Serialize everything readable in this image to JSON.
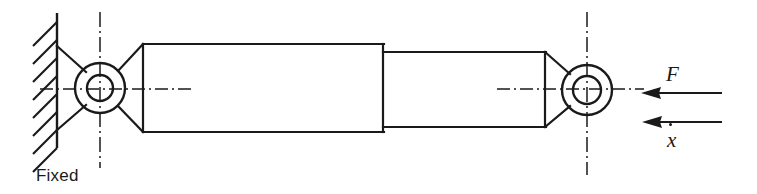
{
  "figure": {
    "type": "engineering-schematic",
    "canvas": {
      "width": 757,
      "height": 194
    },
    "colors": {
      "line": "#1a1a1a",
      "background": "#ffffff"
    }
  },
  "labels": {
    "fixed": "Fixed",
    "force": "F",
    "velocity": "x",
    "velocity_notation": "x-dot"
  },
  "geometry": {
    "wall": {
      "x": 57,
      "y_top": 13,
      "y_bottom": 148,
      "hatch_count": 8
    },
    "left_eye": {
      "cx": 100,
      "cy": 88,
      "r_outer": 25,
      "r_inner": 13
    },
    "right_eye": {
      "cx": 587,
      "cy": 90,
      "r_outer": 25,
      "r_inner": 14
    },
    "barrel": {
      "x_left": 143,
      "x_right": 383,
      "y_top": 44,
      "y_bottom": 132
    },
    "rod": {
      "x_left": 383,
      "x_right": 545,
      "y_top": 52,
      "y_bottom": 127
    },
    "centerline_h": {
      "y": 89
    },
    "centerline_v_left": {
      "x": 100,
      "y_top": 12,
      "y_bottom": 168
    },
    "centerline_v_right": {
      "x": 587,
      "y_top": 12,
      "y_bottom": 175
    }
  },
  "arrows": [
    {
      "name": "force-arrow",
      "label": "F",
      "direction": "left",
      "y": 93,
      "x_tip": 642,
      "x_tail": 722
    },
    {
      "name": "velocity-arrow",
      "label": "x-dot",
      "direction": "left",
      "y": 122,
      "x_tip": 643,
      "x_tail": 722
    }
  ]
}
